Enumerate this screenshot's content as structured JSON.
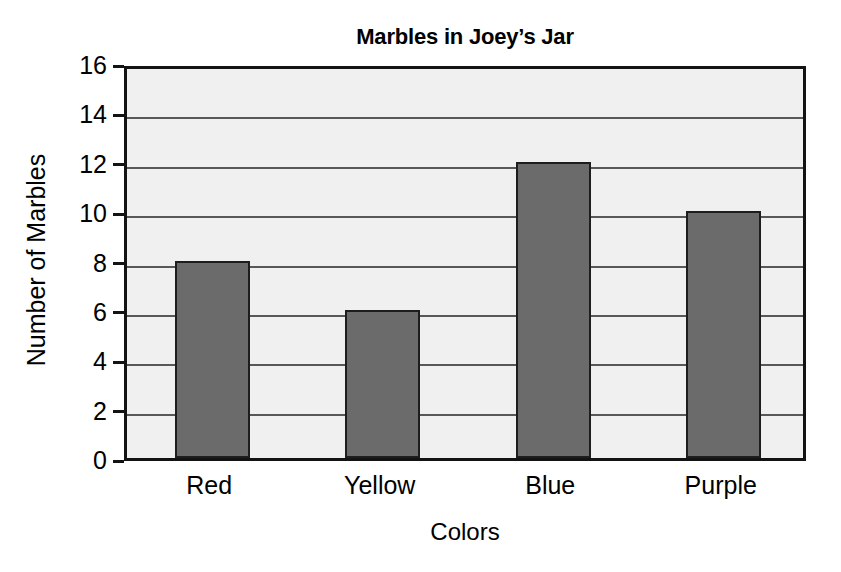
{
  "chart_data": {
    "type": "bar",
    "title": "Marbles in Joey’s Jar",
    "xlabel": "Colors",
    "ylabel": "Number of Marbles",
    "categories": [
      "Red",
      "Yellow",
      "Blue",
      "Purple"
    ],
    "values": [
      8,
      6,
      12,
      10
    ],
    "ylim": [
      0,
      16
    ],
    "ytick_labels": [
      "0",
      "2",
      "4",
      "6",
      "8",
      "10",
      "12",
      "14",
      "16"
    ],
    "ytick_values": [
      0,
      2,
      4,
      6,
      8,
      10,
      12,
      14,
      16
    ],
    "grid": true,
    "grid_axis": "y",
    "legend": false,
    "bar_color": "#6b6b6b",
    "bar_edge_color": "#1d1d1d",
    "plot_background": "#f0f0f0",
    "frame_color": "#131313",
    "gridline_color": "#585858",
    "text_color": "#000000",
    "background": "#ffffff"
  }
}
